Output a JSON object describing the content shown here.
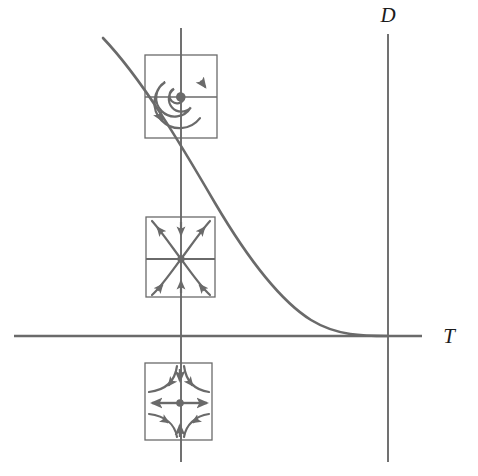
{
  "figure": {
    "kind": "dynamical-systems-classification-diagram",
    "background_color": "#ffffff",
    "line_color": "#6a6a6a",
    "label_color": "#1c1c1c"
  },
  "axes": {
    "horizontal": {
      "name": "trace-axis",
      "label": "T",
      "y": 336,
      "x_start": 14,
      "x_end": 422
    },
    "vertical": {
      "name": "determinant-axis",
      "label": "D",
      "x": 388,
      "y_start": 34,
      "y_end": 462
    },
    "inset_guide_vertical": {
      "name": "inset-alignment-axis",
      "x": 181,
      "y_start": 28,
      "y_end": 462
    },
    "origin": {
      "x": 388,
      "y": 336
    }
  },
  "curve": {
    "name": "discriminant-parabola",
    "description": "T squared equals 4D boundary curve, tangent to the T axis at the origin",
    "equation": "T^2 = 4D",
    "start": {
      "x": 103,
      "y": 38
    },
    "end": {
      "x": 388,
      "y": 336
    },
    "stroke_width": 2.6
  },
  "insets": [
    {
      "name": "inset-spiral-center",
      "portrait_type": "spiral",
      "label": "",
      "box": {
        "x": 145,
        "y": 55,
        "width": 72,
        "height": 83
      },
      "center": {
        "x": 181,
        "y": 97
      },
      "turns": 2.6,
      "direction": "counterclockwise",
      "has_center_dot": true
    },
    {
      "name": "inset-stable-node",
      "portrait_type": "sink",
      "label": "",
      "box": {
        "x": 146,
        "y": 217,
        "width": 69,
        "height": 80
      },
      "center": {
        "x": 181,
        "y": 259
      },
      "flow": "inward",
      "has_center_dot": true
    },
    {
      "name": "inset-saddle",
      "portrait_type": "saddle",
      "label": "",
      "box": {
        "x": 145,
        "y": 363,
        "width": 67,
        "height": 77
      },
      "center": {
        "x": 180,
        "y": 403
      },
      "flow": "horizontal-out-vertical-in",
      "has_center_dot": true
    }
  ]
}
